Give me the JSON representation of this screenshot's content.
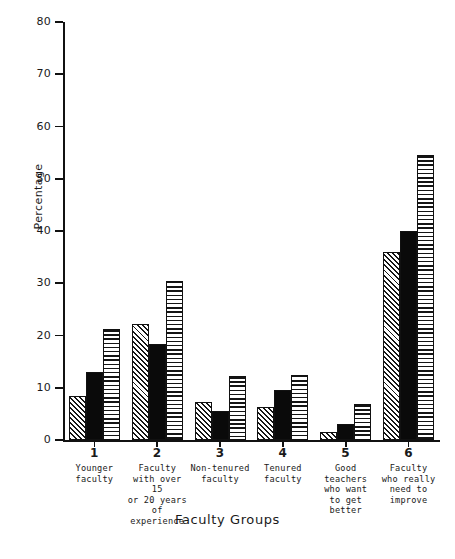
{
  "chart_data": {
    "type": "bar",
    "title": "",
    "xlabel": "Faculty Groups",
    "ylabel": "Percentage",
    "ylim": [
      0,
      80
    ],
    "yticks": [
      0,
      10,
      20,
      30,
      40,
      50,
      60,
      70,
      80
    ],
    "grid": false,
    "legend_position": "none",
    "categories": [
      "1",
      "2",
      "3",
      "4",
      "5",
      "6"
    ],
    "category_descriptions": [
      [
        "Younger",
        "faculty"
      ],
      [
        "Faculty",
        "with over 15",
        "or 20 years",
        "of experience"
      ],
      [
        "Non-tenured",
        "faculty"
      ],
      [
        "Tenured",
        "faculty"
      ],
      [
        "Good",
        "teachers",
        "who want",
        "to get better"
      ],
      [
        "Faculty",
        "who really",
        "need to",
        "improve"
      ]
    ],
    "series": [
      {
        "name": "diagonal-hatch",
        "pattern": "diagonal",
        "values": [
          8.5,
          22.2,
          7.3,
          6.3,
          1.5,
          36.0
        ]
      },
      {
        "name": "solid-black",
        "pattern": "solid",
        "values": [
          13.0,
          18.3,
          5.5,
          9.5,
          3.0,
          40.0
        ]
      },
      {
        "name": "horizontal-hatch",
        "pattern": "horizontal",
        "values": [
          21.2,
          30.5,
          12.2,
          12.5,
          6.8,
          54.5
        ]
      }
    ]
  },
  "colors": {
    "axis": "#111111",
    "solid_bar": "#0a0a0a",
    "background": "#ffffff"
  }
}
